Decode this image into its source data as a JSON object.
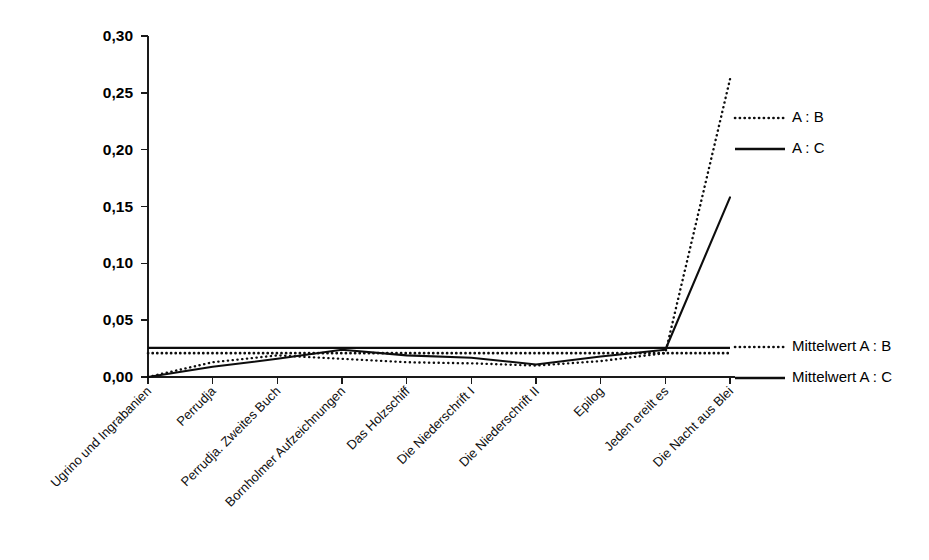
{
  "chart_data": {
    "type": "line",
    "title": "",
    "subtitle": "",
    "xlabel": "",
    "ylabel": "",
    "ylim": [
      0.0,
      0.3
    ],
    "ytick_labels": [
      "0,00",
      "0,05",
      "0,10",
      "0,15",
      "0,20",
      "0,25",
      "0,30"
    ],
    "ytick_values": [
      0.0,
      0.05,
      0.1,
      0.15,
      0.2,
      0.25,
      0.3
    ],
    "grid": false,
    "legend_position": "right",
    "decimal_separator": ",",
    "categories": [
      "Ugrino und Ingrabanien",
      "Perrudja",
      "Perrudja. Zweites Buch",
      "Bornholmer Aufzeichnungen",
      "Das Holzschiff",
      "Die Niederschrift I",
      "Die Niederschrift II",
      "Epilog",
      "Jeden ereilt es",
      "Die Nacht aus Blei"
    ],
    "series": [
      {
        "name": "A : B",
        "style": "dotted",
        "values": [
          0.0,
          0.013,
          0.019,
          0.016,
          0.013,
          0.012,
          0.01,
          0.014,
          0.021,
          0.262
        ]
      },
      {
        "name": "A : C",
        "style": "solid",
        "values": [
          0.0,
          0.009,
          0.016,
          0.024,
          0.019,
          0.017,
          0.011,
          0.018,
          0.024,
          0.158
        ]
      },
      {
        "name": "Mittelwert A : B",
        "style": "dotted",
        "kind": "mean",
        "value": 0.021
      },
      {
        "name": "Mittelwert A : C",
        "style": "solid",
        "kind": "mean",
        "value": 0.0256
      }
    ]
  },
  "legend": {
    "upper": [
      {
        "label": "A : B",
        "style": "dotted"
      },
      {
        "label": "A : C",
        "style": "solid"
      }
    ],
    "lower": [
      {
        "label": "Mittelwert A : B",
        "style": "dotted"
      },
      {
        "label": "Mittelwert A : C",
        "style": "solid"
      }
    ]
  },
  "axes": {
    "y_labels": [
      "0,30",
      "0,25",
      "0,20",
      "0,15",
      "0,10",
      "0,05",
      "0,00"
    ],
    "x_labels": [
      "Ugrino und Ingrabanien",
      "Perrudja",
      "Perrudja. Zweites Buch",
      "Bornholmer Aufzeichnungen",
      "Das Holzschiff",
      "Die Niederschrift I",
      "Die Niederschrift II",
      "Epilog",
      "Jeden ereilt es",
      "Die Nacht aus Blei"
    ]
  }
}
